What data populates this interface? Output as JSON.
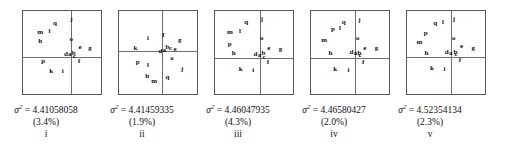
{
  "figure": {
    "type": "scatter-panel-series",
    "panel_count": 5,
    "axis_note": "each panel has a vertical and horizontal axis crossing near the middle-right"
  },
  "chart_data": {
    "type": "scatter",
    "title": "",
    "subtitle": "",
    "xlabel": "",
    "ylabel": "",
    "grid": false,
    "legend": "none",
    "point_label_set": [
      "a",
      "b",
      "c",
      "d",
      "e",
      "f",
      "g",
      "h",
      "i",
      "j",
      "k",
      "l",
      "m",
      "o",
      "p",
      "q"
    ],
    "panels": [
      {
        "id": "i",
        "roman": "i",
        "sigma_symbol": "σ",
        "sigma_exponent": "2",
        "sigma_equals": "=",
        "sigma_value": "4.41058058",
        "percent": "(3.4%)",
        "axis_x_pct": 61,
        "axis_y_pct": 55,
        "points": [
          {
            "label": "q",
            "x": 41,
            "y": 14
          },
          {
            "label": "j",
            "x": 62,
            "y": 10
          },
          {
            "label": "m",
            "x": 22,
            "y": 25
          },
          {
            "label": "l",
            "x": 34,
            "y": 24
          },
          {
            "label": "h",
            "x": 22,
            "y": 36
          },
          {
            "label": "o",
            "x": 62,
            "y": 34
          },
          {
            "label": "e",
            "x": 73,
            "y": 43
          },
          {
            "label": "g",
            "x": 86,
            "y": 45
          },
          {
            "label": "d",
            "x": 55,
            "y": 52
          },
          {
            "label": "a",
            "x": 60,
            "y": 52
          },
          {
            "label": "b",
            "x": 65,
            "y": 51
          },
          {
            "label": "c",
            "x": 66,
            "y": 54
          },
          {
            "label": "f",
            "x": 72,
            "y": 60
          },
          {
            "label": "p",
            "x": 26,
            "y": 60
          },
          {
            "label": "k",
            "x": 36,
            "y": 72
          },
          {
            "label": "i",
            "x": 51,
            "y": 72
          }
        ]
      },
      {
        "id": "ii",
        "roman": "ii",
        "sigma_symbol": "σ",
        "sigma_exponent": "2",
        "sigma_equals": "=",
        "sigma_value": "4.41459335",
        "percent": "(1.9%)",
        "axis_x_pct": 55,
        "axis_y_pct": 48,
        "points": [
          {
            "label": "i",
            "x": 37,
            "y": 32
          },
          {
            "label": "f",
            "x": 57,
            "y": 29
          },
          {
            "label": "g",
            "x": 78,
            "y": 35
          },
          {
            "label": "k",
            "x": 21,
            "y": 44
          },
          {
            "label": "b",
            "x": 62,
            "y": 43
          },
          {
            "label": "c",
            "x": 66,
            "y": 44
          },
          {
            "label": "e",
            "x": 72,
            "y": 46
          },
          {
            "label": "d",
            "x": 53,
            "y": 48
          },
          {
            "label": "a",
            "x": 58,
            "y": 47
          },
          {
            "label": "o",
            "x": 68,
            "y": 57
          },
          {
            "label": "p",
            "x": 24,
            "y": 61
          },
          {
            "label": "l",
            "x": 37,
            "y": 65
          },
          {
            "label": "j",
            "x": 81,
            "y": 70
          },
          {
            "label": "h",
            "x": 36,
            "y": 78
          },
          {
            "label": "q",
            "x": 62,
            "y": 80
          },
          {
            "label": "m",
            "x": 45,
            "y": 84
          }
        ]
      },
      {
        "id": "iii",
        "roman": "iii",
        "sigma_symbol": "σ",
        "sigma_exponent": "2",
        "sigma_equals": "=",
        "sigma_value": "4.46047935",
        "percent": "(4.3%)",
        "axis_x_pct": 58,
        "axis_y_pct": 57,
        "points": [
          {
            "label": "q",
            "x": 40,
            "y": 13
          },
          {
            "label": "j",
            "x": 60,
            "y": 10
          },
          {
            "label": "m",
            "x": 19,
            "y": 25
          },
          {
            "label": "l",
            "x": 32,
            "y": 24
          },
          {
            "label": "o",
            "x": 60,
            "y": 33
          },
          {
            "label": "p",
            "x": 19,
            "y": 40
          },
          {
            "label": "e",
            "x": 69,
            "y": 44
          },
          {
            "label": "g",
            "x": 84,
            "y": 46
          },
          {
            "label": "h",
            "x": 24,
            "y": 51
          },
          {
            "label": "d",
            "x": 52,
            "y": 52
          },
          {
            "label": "a",
            "x": 57,
            "y": 53
          },
          {
            "label": "b",
            "x": 62,
            "y": 51
          },
          {
            "label": "c",
            "x": 63,
            "y": 55
          },
          {
            "label": "f",
            "x": 68,
            "y": 62
          },
          {
            "label": "k",
            "x": 33,
            "y": 70
          },
          {
            "label": "i",
            "x": 49,
            "y": 71
          }
        ]
      },
      {
        "id": "iv",
        "roman": "iv",
        "sigma_symbol": "σ",
        "sigma_exponent": "2",
        "sigma_equals": "=",
        "sigma_value": "4.46580427",
        "percent": "(2.0%)",
        "axis_x_pct": 57,
        "axis_y_pct": 57,
        "points": [
          {
            "label": "q",
            "x": 42,
            "y": 13
          },
          {
            "label": "j",
            "x": 62,
            "y": 11
          },
          {
            "label": "p",
            "x": 28,
            "y": 22
          },
          {
            "label": "l",
            "x": 37,
            "y": 20
          },
          {
            "label": "o",
            "x": 60,
            "y": 33
          },
          {
            "label": "m",
            "x": 17,
            "y": 35
          },
          {
            "label": "e",
            "x": 69,
            "y": 44
          },
          {
            "label": "g",
            "x": 84,
            "y": 45
          },
          {
            "label": "h",
            "x": 25,
            "y": 50
          },
          {
            "label": "d",
            "x": 52,
            "y": 49
          },
          {
            "label": "a",
            "x": 57,
            "y": 51
          },
          {
            "label": "b",
            "x": 62,
            "y": 50
          },
          {
            "label": "c",
            "x": 63,
            "y": 53
          },
          {
            "label": "f",
            "x": 67,
            "y": 61
          },
          {
            "label": "k",
            "x": 31,
            "y": 70
          },
          {
            "label": "i",
            "x": 48,
            "y": 71
          }
        ]
      },
      {
        "id": "v",
        "roman": "v",
        "sigma_symbol": "σ",
        "sigma_exponent": "2",
        "sigma_equals": "=",
        "sigma_value": "4.52354134",
        "percent": "(2.3%)",
        "axis_x_pct": 57,
        "axis_y_pct": 56,
        "points": [
          {
            "label": "q",
            "x": 36,
            "y": 15
          },
          {
            "label": "l",
            "x": 46,
            "y": 13
          },
          {
            "label": "j",
            "x": 60,
            "y": 10
          },
          {
            "label": "p",
            "x": 24,
            "y": 26
          },
          {
            "label": "o",
            "x": 60,
            "y": 33
          },
          {
            "label": "m",
            "x": 16,
            "y": 37
          },
          {
            "label": "e",
            "x": 70,
            "y": 42
          },
          {
            "label": "g",
            "x": 85,
            "y": 44
          },
          {
            "label": "h",
            "x": 25,
            "y": 50
          },
          {
            "label": "d",
            "x": 51,
            "y": 49
          },
          {
            "label": "a",
            "x": 56,
            "y": 50
          },
          {
            "label": "b",
            "x": 62,
            "y": 49
          },
          {
            "label": "c",
            "x": 63,
            "y": 52
          },
          {
            "label": "f",
            "x": 68,
            "y": 59
          },
          {
            "label": "k",
            "x": 32,
            "y": 69
          },
          {
            "label": "i",
            "x": 48,
            "y": 70
          }
        ]
      }
    ]
  }
}
